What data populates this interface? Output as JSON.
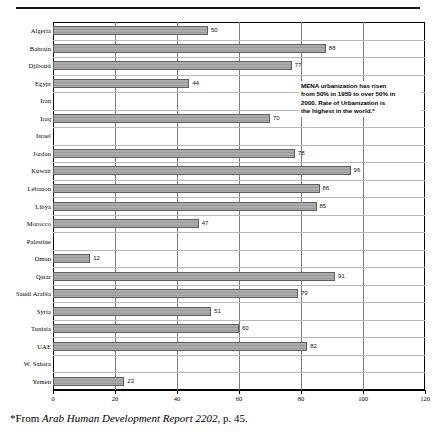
{
  "chart_data": {
    "type": "bar",
    "orientation": "horizontal",
    "title": "",
    "xlabel": "",
    "ylabel": "",
    "xlim": [
      0,
      120
    ],
    "xticks": [
      0,
      20,
      40,
      60,
      80,
      100,
      120
    ],
    "grid": true,
    "legend": "none",
    "categories": [
      "Algeria",
      "Bahrain",
      "Djibouti",
      "Egypt",
      "Iran",
      "Iraq",
      "Israel",
      "Jordan",
      "Kuwait",
      "Lebanon",
      "Libya",
      "Morocco",
      "Palestine",
      "Oman",
      "Qatar",
      "Saudi Arabia",
      "Syria",
      "Tunisia",
      "UAE",
      "W. Sahara",
      "Yemen"
    ],
    "values": [
      50,
      88,
      77,
      44,
      null,
      70,
      null,
      78,
      96,
      86,
      85,
      47,
      null,
      12,
      91,
      79,
      51,
      60,
      82,
      null,
      23
    ],
    "value_labels": [
      "50",
      "88",
      "77",
      "44",
      "",
      "70",
      "",
      "78",
      "96",
      "86",
      "85",
      "47",
      "",
      "12",
      "91",
      "79",
      "51",
      "60",
      "82",
      "",
      "23"
    ],
    "annotations": [
      {
        "name": "mena-urbanization-note",
        "lines": [
          "MENA urbanization has risen",
          "from 50% in 1950 to over 50% in",
          "2000. Rate of Urbanization is",
          "the highest in the world.*"
        ]
      }
    ],
    "bar_color": "#a3a3a3",
    "bar_border_color": "#5f5f5f",
    "gridline_color": "#7c7c7c"
  },
  "footnote": {
    "prefix": "*From ",
    "source_italic": "Arab Human Development Report 2202",
    "suffix": ", p. 45."
  }
}
